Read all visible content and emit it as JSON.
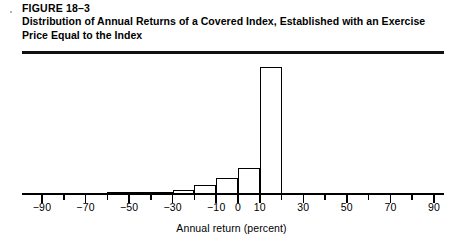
{
  "figure": {
    "label": "FIGURE 18–3",
    "title": "Distribution of Annual Returns of a Covered Index, Established with an Exercise Price Equal to the Index"
  },
  "chart_data": {
    "type": "bar",
    "title": "Distribution of Annual Returns of a Covered Index, Established with an Exercise Price Equal to the Index",
    "xlabel": "Annual return (percent)",
    "ylabel": "",
    "xlim": [
      -90,
      90
    ],
    "ylim": [
      0,
      100
    ],
    "grid": false,
    "legend": null,
    "bin_width": 10,
    "categories": [
      "-90 to -80",
      "-80 to -70",
      "-70 to -60",
      "-60 to -50",
      "-50 to -40",
      "-40 to -30",
      "-30 to -20",
      "-20 to -10",
      "-10 to 0",
      "0 to 10",
      "10 to 20",
      "20 to 30",
      "30 to 40",
      "40 to 50",
      "50 to 60",
      "60 to 70",
      "70 to 80",
      "80 to 90"
    ],
    "bin_edges": [
      -90,
      -80,
      -70,
      -60,
      -50,
      -40,
      -30,
      -20,
      -10,
      0,
      10,
      20,
      30,
      40,
      50,
      60,
      70,
      80,
      90
    ],
    "values": [
      0,
      0,
      0,
      1,
      1,
      1,
      2,
      6,
      12,
      20,
      100,
      0,
      0,
      0,
      0,
      0,
      0,
      0
    ],
    "x_ticks_major": [
      -90,
      -70,
      -50,
      -30,
      -10,
      0,
      10,
      30,
      50,
      70,
      90
    ],
    "x_ticks_minor": [
      -80,
      -60,
      -40,
      -20,
      20,
      40,
      60,
      80
    ],
    "x_tick_labels": [
      {
        "value": -90,
        "text": "−90"
      },
      {
        "value": -70,
        "text": "−70"
      },
      {
        "value": -50,
        "text": "−50"
      },
      {
        "value": -30,
        "text": "−30"
      },
      {
        "value": -10,
        "text": "−10"
      },
      {
        "value": 0,
        "text": "0"
      },
      {
        "value": 10,
        "text": "10"
      },
      {
        "value": 30,
        "text": "30"
      },
      {
        "value": 50,
        "text": "50"
      },
      {
        "value": 70,
        "text": "70"
      },
      {
        "value": 90,
        "text": "90"
      }
    ]
  },
  "colors": {
    "ink": "#000000",
    "rule": "#111111",
    "background": "#ffffff"
  }
}
